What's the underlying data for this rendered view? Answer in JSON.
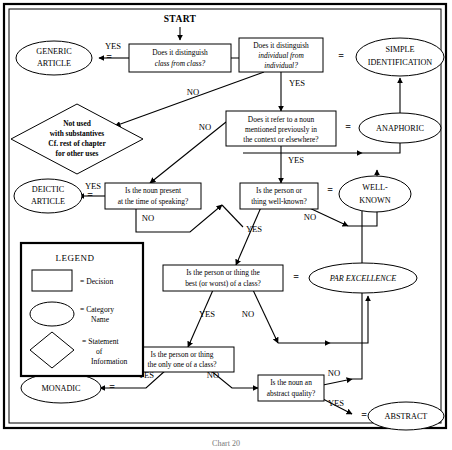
{
  "figure": {
    "caption": "Chart 20",
    "start_label": "START",
    "equals_sign": "="
  },
  "legend": {
    "title": "LEGEND",
    "items": [
      {
        "shape": "rectangle",
        "label": "=  Decision"
      },
      {
        "shape": "ellipse",
        "label_line1": "=  Category",
        "label_line2": "Name"
      },
      {
        "shape": "diamond",
        "label_line1": "=  Statement",
        "label_line2": "of",
        "label_line3": "Information"
      }
    ]
  },
  "decisions": [
    {
      "id": "d1",
      "line1": "Does it distinguish",
      "line2": "class  from class?",
      "line2_italic": true
    },
    {
      "id": "d2",
      "line1": "Does it distinguish",
      "line2": "individual from",
      "line3": "individual?",
      "line2_italic": true
    },
    {
      "id": "d3",
      "line1": "Does it refer to a noun",
      "line2": "mentioned previously in",
      "line3": "the context or elsewhere?"
    },
    {
      "id": "d4",
      "line1": "Is the noun present",
      "line2": "at the time of speaking?"
    },
    {
      "id": "d5",
      "line1": "Is the person or",
      "line2": "thing well-known?"
    },
    {
      "id": "d6",
      "line1": "Is the person or thing the",
      "line2": "best (or worst) of a class?"
    },
    {
      "id": "d7",
      "line1": "Is the person or thing",
      "line2": "the only one of a class?"
    },
    {
      "id": "d8",
      "line1": "Is the noun an",
      "line2": "abstract quality?"
    }
  ],
  "categories": [
    {
      "id": "c_generic",
      "line1": "GENERIC",
      "line2": "ARTICLE",
      "italic": false
    },
    {
      "id": "c_simple",
      "line1": "SIMPLE",
      "line2": "IDENTIFICATION",
      "italic": false
    },
    {
      "id": "c_anaphoric",
      "line1": "ANAPHORIC",
      "italic": false
    },
    {
      "id": "c_deictic",
      "line1": "DEICTIC",
      "line2": "ARTICLE",
      "italic": false
    },
    {
      "id": "c_wellknown",
      "line1": "WELL-",
      "line2": "KNOWN",
      "italic": false
    },
    {
      "id": "c_parexcellence",
      "line1": "PAR EXCELLENCE",
      "italic": true
    },
    {
      "id": "c_monadic",
      "line1": "MONADIC",
      "italic": false
    },
    {
      "id": "c_abstract",
      "line1": "ABSTRACT",
      "italic": false
    }
  ],
  "statements": [
    {
      "id": "s_notused",
      "line1": "Not used",
      "line2": "with substantives",
      "line3": "Cf. rest of chapter",
      "line4": "for other uses"
    }
  ],
  "edge_labels": {
    "yes": "YES",
    "no": "NO",
    "d1_yes": "YES",
    "d1_no": "NO",
    "d2_yes": "YES",
    "d2_no": "NO",
    "d3_yes": "YES",
    "d3_no": "NO",
    "d4_yes": "YES",
    "d4_no": "NO",
    "d5_yes": "YES",
    "d5_no": "NO",
    "d6_yes": "YES",
    "d6_no": "NO",
    "d7_yes": "YES",
    "d7_no": "NO",
    "d8_yes": "YES",
    "d8_no": "NO"
  },
  "colors": {
    "stroke": "#000000",
    "background": "#ffffff",
    "caption": "#777777"
  }
}
